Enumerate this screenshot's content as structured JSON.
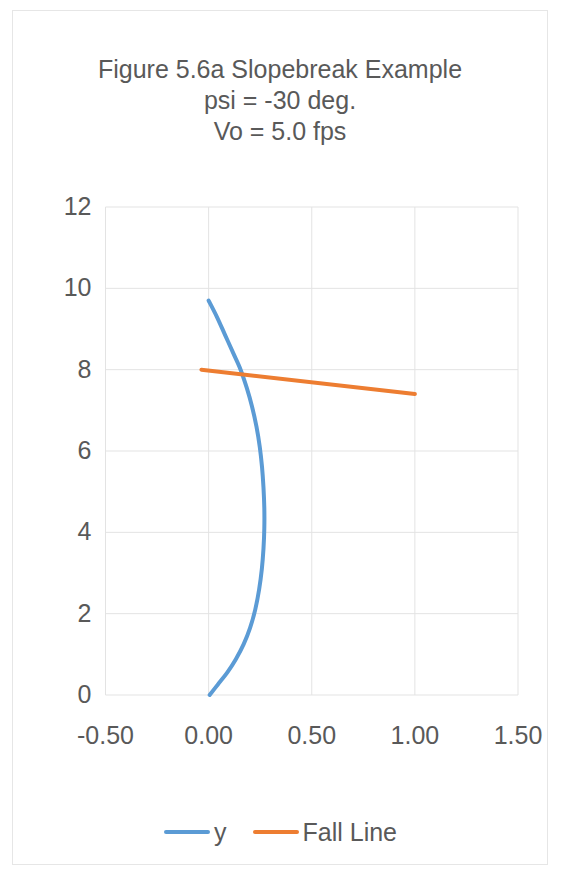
{
  "chart_data": {
    "type": "line",
    "title": "Figure 5.6a Slopebreak Example\npsi = -30 deg.\nVo = 5.0 fps",
    "title_lines": [
      "Figure 5.6a Slopebreak Example",
      "psi = -30 deg.",
      "Vo = 5.0 fps"
    ],
    "xlabel": "",
    "ylabel": "",
    "xlim": [
      -0.5,
      1.5
    ],
    "ylim": [
      0,
      12
    ],
    "xticks": [
      -0.5,
      0.0,
      0.5,
      1.0,
      1.5
    ],
    "xtick_labels": [
      "-0.50",
      "0.00",
      "0.50",
      "1.00",
      "1.50"
    ],
    "yticks": [
      0,
      2,
      4,
      6,
      8,
      10,
      12
    ],
    "ytick_labels": [
      "0",
      "2",
      "4",
      "6",
      "8",
      "10",
      "12"
    ],
    "grid": true,
    "legend_position": "bottom",
    "series": [
      {
        "name": "y",
        "color": "#5B9BD5",
        "orientation": "x_as_function_of_y",
        "points": [
          [
            0.0,
            9.7
          ],
          [
            0.04,
            9.3
          ],
          [
            0.08,
            8.85
          ],
          [
            0.12,
            8.4
          ],
          [
            0.155,
            8.0
          ],
          [
            0.185,
            7.55
          ],
          [
            0.21,
            7.1
          ],
          [
            0.232,
            6.6
          ],
          [
            0.248,
            6.1
          ],
          [
            0.259,
            5.6
          ],
          [
            0.266,
            5.1
          ],
          [
            0.27,
            4.6
          ],
          [
            0.27,
            4.1
          ],
          [
            0.266,
            3.6
          ],
          [
            0.258,
            3.1
          ],
          [
            0.245,
            2.6
          ],
          [
            0.226,
            2.1
          ],
          [
            0.201,
            1.65
          ],
          [
            0.17,
            1.25
          ],
          [
            0.132,
            0.88
          ],
          [
            0.09,
            0.55
          ],
          [
            0.045,
            0.26
          ],
          [
            0.005,
            0.0
          ]
        ]
      },
      {
        "name": "Fall Line",
        "color": "#ED7D31",
        "orientation": "y_as_function_of_x",
        "points": [
          [
            -0.035,
            8.0
          ],
          [
            1.0,
            7.4
          ]
        ]
      }
    ],
    "legend": [
      {
        "label": "y",
        "color": "#5B9BD5"
      },
      {
        "label": "Fall Line",
        "color": "#ED7D31"
      }
    ]
  },
  "colors": {
    "series_y": "#5B9BD5",
    "series_fall_line": "#ED7D31",
    "grid": "#E3E3E3",
    "text": "#595959",
    "page_border": "#E6E6E6"
  },
  "ticks": {
    "y": [
      "12",
      "10",
      "8",
      "6",
      "4",
      "2",
      "0"
    ],
    "x": [
      "-0.50",
      "0.00",
      "0.50",
      "1.00",
      "1.50"
    ]
  },
  "legend": {
    "items": [
      {
        "label": "y"
      },
      {
        "label": "Fall Line"
      }
    ]
  }
}
